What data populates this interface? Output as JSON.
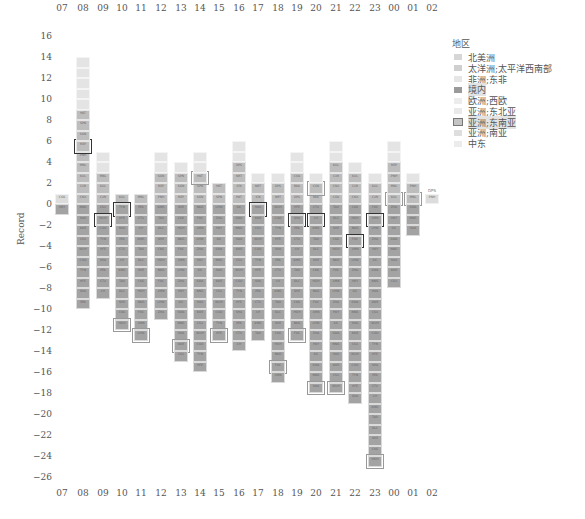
{
  "chart_data": {
    "type": "bar",
    "subtype": "stacked-unit-blocks",
    "title": "",
    "xlabel": "",
    "ylabel": "Record",
    "ylim": [
      -26,
      16
    ],
    "yticks": [
      16,
      14,
      12,
      10,
      8,
      6,
      4,
      2,
      0,
      -2,
      -4,
      -6,
      -8,
      -10,
      -12,
      -14,
      -16,
      -18,
      -20,
      -22,
      -24,
      -26
    ],
    "categories": [
      "07",
      "08",
      "09",
      "10",
      "11",
      "12",
      "13",
      "14",
      "15",
      "16",
      "17",
      "18",
      "19",
      "20",
      "21",
      "22",
      "23",
      "00",
      "01",
      "02"
    ],
    "series": [
      {
        "name": "国外(上方)",
        "values": [
          1,
          14,
          5,
          1,
          1,
          5,
          4,
          5,
          2,
          6,
          3,
          3,
          5,
          3,
          6,
          4,
          3,
          6,
          3,
          1
        ]
      },
      {
        "name": "境内(下方)",
        "values": [
          -1,
          -10,
          -9,
          -12,
          -13,
          -11,
          -15,
          -16,
          -13,
          -14,
          -13,
          -17,
          -13,
          -18,
          -18,
          -19,
          -25,
          -8,
          -3,
          0
        ]
      }
    ],
    "legend": {
      "title": "地区",
      "position": "right",
      "entries": [
        "北美洲",
        "太洋洲;太平洋西南部",
        "非洲;东非",
        "境内",
        "欧洲;西欧",
        "亚洲;东北亚",
        "亚洲;东南亚",
        "亚洲;南亚",
        "中东"
      ]
    },
    "annotations": [
      "DPS"
    ],
    "grid": false
  },
  "axis": {
    "x_top": [
      "07",
      "08",
      "09",
      "10",
      "11",
      "12",
      "13",
      "14",
      "15",
      "16",
      "17",
      "18",
      "19",
      "20",
      "21",
      "22",
      "23",
      "00",
      "01",
      "02"
    ],
    "x_bottom": [
      "07",
      "08",
      "09",
      "10",
      "11",
      "12",
      "13",
      "14",
      "15",
      "16",
      "17",
      "18",
      "19",
      "20",
      "21",
      "22",
      "23",
      "00",
      "01",
      "02"
    ],
    "y": [
      "16",
      "14",
      "12",
      "10",
      "8",
      "6",
      "4",
      "2",
      "0",
      "−2",
      "−4",
      "−6",
      "−8",
      "−10",
      "−12",
      "−14",
      "−16",
      "−18",
      "−20",
      "−22",
      "−24",
      "−26"
    ],
    "y_title": "Record"
  },
  "legend": {
    "title": "地区",
    "items": [
      {
        "label": "北美洲",
        "color": "#d6d6d6"
      },
      {
        "label": "太洋洲;太平洋西南部",
        "color": "#cfcfcf"
      },
      {
        "label": "非洲;东非",
        "color": "#e6e6e6"
      },
      {
        "label": "境内",
        "color": "#9a9a9a"
      },
      {
        "label": "欧洲;西欧",
        "color": "#ececec"
      },
      {
        "label": "亚洲;东北亚",
        "color": "#e9e9e9"
      },
      {
        "label": "亚洲;东南亚",
        "color": "#c4c4c4"
      },
      {
        "label": "亚洲;南亚",
        "color": "#dedede"
      },
      {
        "label": "中东",
        "color": "#ececec"
      }
    ]
  },
  "annotation_label": "DPS",
  "colors": {
    "domestic": "#a3a3a3",
    "foreign_dark": "#bdbdbd",
    "foreign_light": "#e4e4e4",
    "highlight_border": "#333333"
  }
}
